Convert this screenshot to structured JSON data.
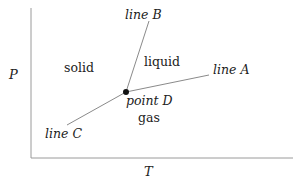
{
  "diagram": {
    "type": "phase-diagram",
    "axes": {
      "x_label": "T",
      "y_label": "P"
    },
    "regions": {
      "solid": "solid",
      "liquid": "liquid",
      "gas": "gas"
    },
    "lines": {
      "a": "line A",
      "b": "line B",
      "c": "line C"
    },
    "point": "point D",
    "colors": {
      "axis": "#9a9a9a",
      "line": "#8a8a8a",
      "point": "#111111",
      "text": "#222222"
    }
  }
}
